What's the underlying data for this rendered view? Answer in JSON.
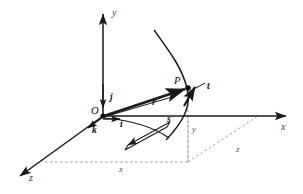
{
  "figure": {
    "background_color": "#ffffff",
    "line_color": "#1a1a1a",
    "dash_color": "#8a8a8a"
  },
  "axes": [
    {
      "id": "y-axis",
      "label": "y",
      "direction": "up",
      "label_x": 112,
      "label_y": 8
    },
    {
      "id": "x-axis",
      "label": "x",
      "direction": "right",
      "label_x": 281,
      "label_y": 122
    },
    {
      "id": "z-axis",
      "label": "z",
      "direction": "down-left",
      "label_x": 29,
      "label_y": 173
    }
  ],
  "unit_vectors": [
    {
      "id": "i-hat",
      "label": "i",
      "along": "x-axis",
      "label_x": 120,
      "label_y": 120
    },
    {
      "id": "j-hat",
      "label": "j",
      "along": "y-axis",
      "label_x": 110,
      "label_y": 93
    },
    {
      "id": "k-hat",
      "label": "k",
      "along": "z-axis",
      "label_x": 92,
      "label_y": 126
    }
  ],
  "points": [
    {
      "id": "origin",
      "label": "O",
      "x": 103,
      "y": 116,
      "label_x": 91,
      "label_y": 106
    },
    {
      "id": "point-p",
      "label": "P",
      "x": 188,
      "y": 88,
      "label_x": 174,
      "label_y": 76
    }
  ],
  "vectors": [
    {
      "id": "position-vector",
      "label": "r",
      "from": "origin",
      "to": "point-p",
      "label_x": 152,
      "label_y": 98
    },
    {
      "id": "tangent-vector",
      "label": "t",
      "from": "point-p",
      "to": "tangent-tip",
      "label_x": 207,
      "label_y": 82
    }
  ],
  "curve": {
    "id": "trajectory-curve",
    "description": "smooth space curve passing through P"
  },
  "arc_length": {
    "id": "arc-length-arrow",
    "label": "s",
    "label_x": 167,
    "label_y": 115,
    "description": "double-line arrow indicating arc length direction along the curve"
  },
  "projection": {
    "id": "projection-lines",
    "style": "dashed",
    "components": [
      {
        "id": "x-component",
        "label": "x",
        "label_x": 119,
        "label_y": 165
      },
      {
        "id": "y-component",
        "label": "y",
        "label_x": 192,
        "label_y": 125
      },
      {
        "id": "z-component",
        "label": "z",
        "label_x": 236,
        "label_y": 145
      }
    ]
  }
}
